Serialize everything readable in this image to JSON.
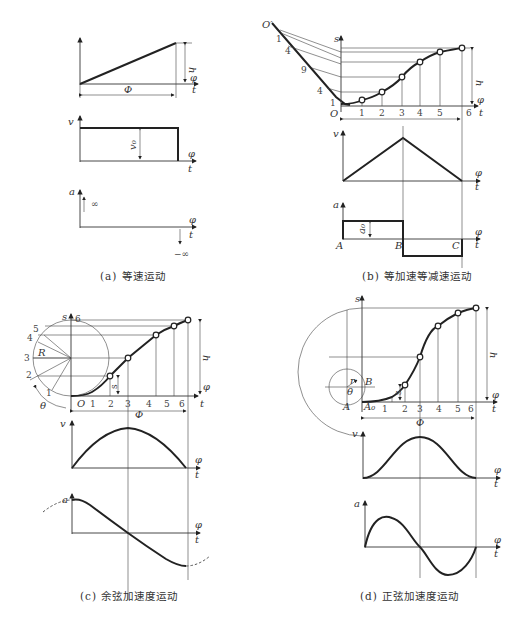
{
  "figure": {
    "panels": [
      {
        "id": "a",
        "caption": "(a) 等速运动",
        "labels": {
          "s_h": "h",
          "phi": "φ",
          "t": "t",
          "Phi": "Φ",
          "v": "v",
          "v0": "v₀",
          "a": "a",
          "plus_inf": "+∞",
          "minus_inf": "−∞"
        }
      },
      {
        "id": "b",
        "caption": "(b) 等加速等减速运动",
        "labels": {
          "O_prime": "O′",
          "O": "O",
          "s": "s",
          "h": "h",
          "phi": "φ",
          "t": "t",
          "v": "v",
          "a": "a",
          "a0": "a₀",
          "A": "A",
          "B": "B",
          "C": "C"
        },
        "left_ticks": [
          "1",
          "4",
          "9",
          "4",
          "1"
        ],
        "x_ticks": [
          "1",
          "2",
          "3",
          "4",
          "5",
          "6"
        ]
      },
      {
        "id": "c",
        "caption": "(c) 余弦加速度运动",
        "labels": {
          "s": "s",
          "R": "R",
          "theta": "θ",
          "O": "O",
          "h": "h",
          "Phi": "Φ",
          "phi": "φ",
          "t": "t",
          "v": "v",
          "a": "a",
          "s_small": "s"
        },
        "circle_ticks": [
          "1",
          "2",
          "3",
          "4",
          "5",
          "6"
        ],
        "x_ticks": [
          "1",
          "2",
          "3",
          "4",
          "5",
          "6"
        ]
      },
      {
        "id": "d",
        "caption": "(d) 正弦加速度运动",
        "labels": {
          "s": "s",
          "r": "r",
          "B": "B",
          "theta": "θ",
          "A": "A",
          "A0": "A₀",
          "h": "h",
          "Phi": "Φ",
          "phi": "φ",
          "t": "t",
          "v": "v",
          "a": "a",
          "s_small": "s"
        },
        "x_ticks": [
          "1",
          "2",
          "3",
          "4",
          "5",
          "6"
        ]
      }
    ]
  }
}
